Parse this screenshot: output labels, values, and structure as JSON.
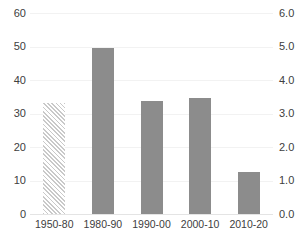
{
  "chart_data": {
    "type": "bar",
    "title": "",
    "xlabel": "",
    "ylabel": "",
    "categories": [
      "1950-80",
      "1980-90",
      "1990-00",
      "2000-10",
      "2010-20"
    ],
    "values": [
      33.2,
      49.5,
      33.7,
      34.5,
      12.5
    ],
    "series": [
      {
        "name": "",
        "values": [
          33.2,
          49.5,
          33.7,
          34.5,
          12.5
        ],
        "styles": [
          "hatched",
          "solid",
          "solid",
          "solid",
          "solid"
        ]
      }
    ],
    "left_axis": {
      "label": "",
      "ylim": [
        0,
        60
      ],
      "ticks": [
        0,
        10,
        20,
        30,
        40,
        50,
        60
      ],
      "tick_labels": [
        "0",
        "10",
        "20",
        "30",
        "40",
        "50",
        "60"
      ]
    },
    "right_axis": {
      "label": "",
      "ylim": [
        0.0,
        6.0
      ],
      "ticks": [
        0.0,
        1.0,
        2.0,
        3.0,
        4.0,
        5.0,
        6.0
      ],
      "tick_labels": [
        "0.0",
        "1.0",
        "2.0",
        "3.0",
        "4.0",
        "5.0",
        "6.0"
      ]
    },
    "grid": true,
    "legend": "none",
    "colors": {
      "bar_fill": "#8c8c8c",
      "hatch_stroke": "#c9c9c9",
      "gridline": "#f2f2f2",
      "baseline": "#e4e4e4",
      "text": "#404040",
      "background": "#ffffff"
    }
  }
}
